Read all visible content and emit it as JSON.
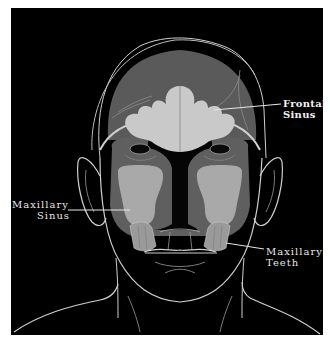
{
  "figure": {
    "background_color": "#000000",
    "page_color": "#ffffff",
    "colors": {
      "outline": "#d6d6d6",
      "forehead_region": "#5a5a5a",
      "face_region": "#5f5f5f",
      "frontal_sinus": "#c9c9c9",
      "maxillary_sinus": "#a9a9a9",
      "teeth": "#9a9a9a"
    }
  },
  "labels": {
    "frontal_sinus": {
      "line1": "Frontal",
      "line2": "Sinus"
    },
    "maxillary_sinus": {
      "line1": "Maxillary",
      "line2": "Sinus"
    },
    "maxillary_teeth": {
      "line1": "Maxillary",
      "line2": "Teeth"
    }
  }
}
